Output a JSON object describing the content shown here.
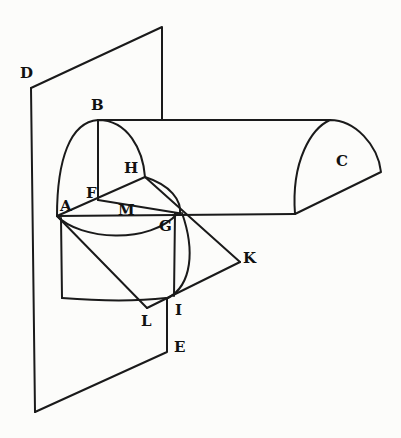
{
  "figure": {
    "labels": {
      "D": "D",
      "B": "B",
      "C": "C",
      "H": "H",
      "F": "F",
      "A": "A",
      "M": "M",
      "G": "G",
      "K": "K",
      "L": "L",
      "I": "I",
      "E": "E"
    }
  }
}
